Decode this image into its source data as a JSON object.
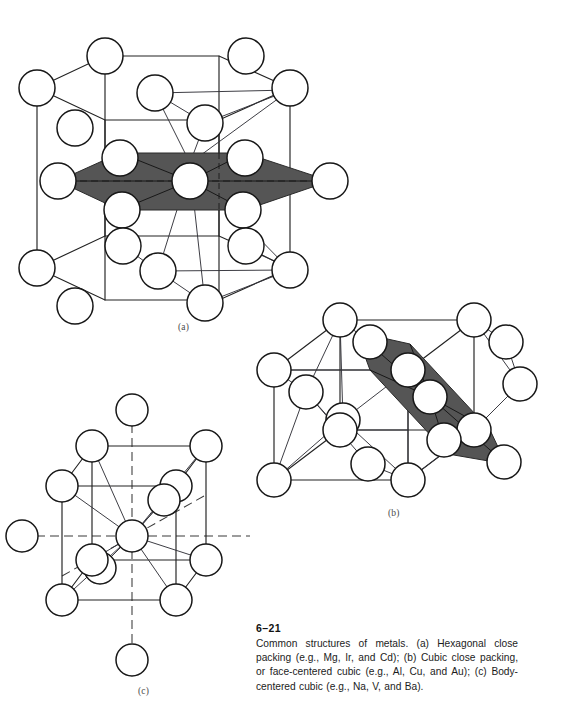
{
  "figure": {
    "number": "6–21",
    "caption": "Common structures of metals.  (a) Hexagonal close packing (e.g., Mg, Ir, and Cd);  (b) Cubic close packing, or face-centered cubic (e.g., Al, Cu, and Au);  (c) Body-centered cubic (e.g., Na, V, and Ba).",
    "background_color": "#ffffff",
    "atom_fill_color": "#ffffff",
    "atom_stroke_color": "#171717",
    "bond_color": "#222222",
    "plane_fill_color": "#555555"
  },
  "panels": [
    {
      "id": "a",
      "sublabel": "(a)",
      "structure_name": "Hexagonal close packing",
      "examples": [
        "Mg",
        "Ir",
        "Cd"
      ],
      "highlighted_plane": "hexagonal close-packed layer",
      "coordination_number": 12
    },
    {
      "id": "b",
      "sublabel": "(b)",
      "structure_name": "Cubic close packing, or face-centered cubic",
      "examples": [
        "Al",
        "Cu",
        "Au"
      ],
      "highlighted_plane": "diagonal close-packed layer",
      "coordination_number": 12
    },
    {
      "id": "c",
      "sublabel": "(c)",
      "structure_name": "Body-centered cubic",
      "examples": [
        "Na",
        "V",
        "Ba"
      ],
      "highlighted_plane": "none",
      "coordination_number": 8
    }
  ]
}
